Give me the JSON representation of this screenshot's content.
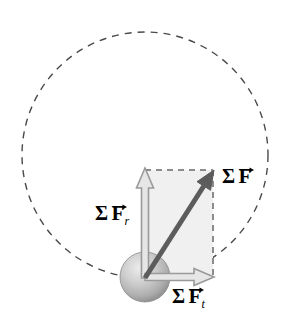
{
  "figure": {
    "background_color": "#ffffff"
  },
  "circle": {
    "name": "circular-path",
    "center_x": 145,
    "center_y": 155,
    "radius": 123,
    "stroke_color": "#4a4a4a",
    "stroke_width": 1.4,
    "dash_pattern": "7 6",
    "fill": "none"
  },
  "ball": {
    "name": "particle",
    "center_x": 145,
    "center_y": 277,
    "radius": 25,
    "fill_light": "#e8e8e8",
    "fill_mid": "#bdbdbd",
    "fill_dark": "#8f8f8f",
    "stroke_color": "#8a8a8a"
  },
  "rectangle": {
    "name": "component-rectangle",
    "x": 145,
    "y": 170,
    "width": 68,
    "height": 108,
    "fill_color": "#f0f0f0",
    "dash_stroke_color": "#8c8c8c",
    "dash_pattern": "6 5",
    "dash_width": 2
  },
  "vectors": {
    "radial": {
      "name": "radial-force-vector",
      "origin_x": 145,
      "origin_y": 278,
      "tip_x": 145,
      "tip_y": 168,
      "style": "hollow-outline",
      "stroke_color": "#9a9a9a",
      "fill_color": "#e6e6e6",
      "shaft_width": 7,
      "head_width": 17,
      "head_length": 20
    },
    "tangential": {
      "name": "tangential-force-vector",
      "origin_x": 145,
      "origin_y": 277,
      "tip_x": 214,
      "tip_y": 277,
      "style": "hollow-outline",
      "stroke_color": "#9a9a9a",
      "fill_color": "#e6e6e6",
      "shaft_width": 7,
      "head_width": 17,
      "head_length": 20
    },
    "resultant": {
      "name": "resultant-force-vector",
      "origin_x": 145,
      "origin_y": 278,
      "tip_x": 214,
      "tip_y": 170,
      "style": "solid-filled",
      "stroke_color": "#5c5c5c",
      "fill_color": "#5c5c5c",
      "shaft_width": 5,
      "head_width": 16,
      "head_length": 19
    }
  },
  "labels": {
    "resultant": {
      "name": "label-sum-f",
      "sigma": "Σ",
      "symbol": "F",
      "subscript": "",
      "text": "Σ F"
    },
    "radial": {
      "name": "label-sum-f-r",
      "sigma": "Σ",
      "symbol": "F",
      "subscript": "r",
      "text": "Σ F_r"
    },
    "tangential": {
      "name": "label-sum-f-t",
      "sigma": "Σ",
      "symbol": "F",
      "subscript": "t",
      "text": "Σ F_t"
    }
  }
}
